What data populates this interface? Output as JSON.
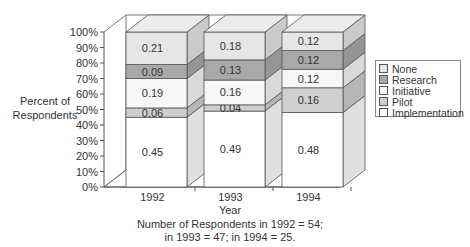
{
  "chart_data": {
    "type": "bar",
    "stacked": true,
    "style": "3d",
    "title": "",
    "xlabel": "Year",
    "ylabel": "Percent of Respondents",
    "categories": [
      "1992",
      "1993",
      "1994"
    ],
    "y_ticks": [
      "0%",
      "10%",
      "20%",
      "30%",
      "40%",
      "50%",
      "60%",
      "70%",
      "80%",
      "90%",
      "100%"
    ],
    "ylim": [
      0,
      100
    ],
    "series": [
      {
        "name": "Implementation",
        "values": [
          0.45,
          0.49,
          0.48
        ],
        "color": "#ffffff"
      },
      {
        "name": "Pilot",
        "values": [
          0.06,
          0.04,
          0.16
        ],
        "color": "#cfcfcf"
      },
      {
        "name": "Initiative",
        "values": [
          0.19,
          0.16,
          0.12
        ],
        "color": "#f7f7f7"
      },
      {
        "name": "Research",
        "values": [
          0.09,
          0.13,
          0.12
        ],
        "color": "#a9a9a9"
      },
      {
        "name": "None",
        "values": [
          0.21,
          0.18,
          0.12
        ],
        "color": "#e6e6e6"
      }
    ],
    "value_labels": [
      [
        "0.45",
        "0.06",
        "0.19",
        "0.09",
        "0.21"
      ],
      [
        "0.49",
        "0.04",
        "0.16",
        "0.13",
        "0.18"
      ],
      [
        "0.48",
        "0.16",
        "0.12",
        "0.12",
        "0.12"
      ]
    ],
    "legend": {
      "position": "right",
      "entries": [
        "None",
        "Research",
        "Initiative",
        "Pilot",
        "Implementation"
      ]
    },
    "grid": false,
    "annotations": [
      "Number of Respondents in 1992 = 54;",
      "in 1993 = 47; in 1994 = 25."
    ]
  },
  "axis": {
    "ylabel_line1": "Percent of",
    "ylabel_line2": "Respondents",
    "xlabel": "Year"
  },
  "caption": {
    "line1": "Number of Respondents in 1992 = 54;",
    "line2": "in 1993 = 47; in 1994 = 25."
  },
  "legend": {
    "items": [
      {
        "label": "None",
        "color": "#e6e6e6"
      },
      {
        "label": "Research",
        "color": "#a9a9a9"
      },
      {
        "label": "Initiative",
        "color": "#f7f7f7"
      },
      {
        "label": "Pilot",
        "color": "#cfcfcf"
      },
      {
        "label": "Implementation",
        "color": "#ffffff"
      }
    ]
  }
}
